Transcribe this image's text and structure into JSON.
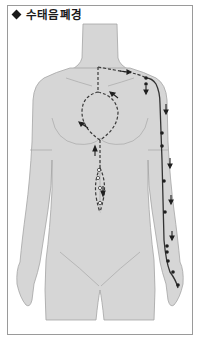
{
  "title": "수태음폐경",
  "title_marker": "diamond-icon",
  "figure": {
    "meridian": {
      "name": "수태음폐경",
      "line_color": "#333333",
      "internal_path_style": "dashed",
      "external_path_style": "solid",
      "point_marker": "filled-dot",
      "direction_marker": "arrow"
    },
    "colors": {
      "body_fill": "#d6d6d6",
      "body_outline": "#9e9e9e",
      "frame_border": "#9a9a9a",
      "background": "#ffffff"
    }
  }
}
